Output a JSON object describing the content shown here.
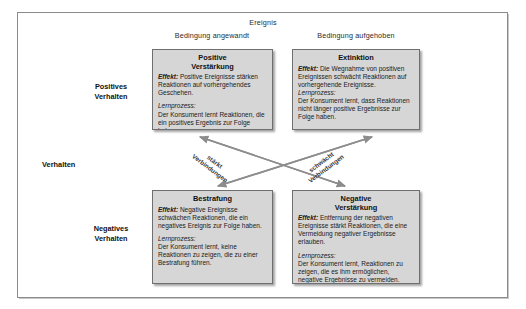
{
  "diagram": {
    "top_title": "Ereignis",
    "axis_label": "Verhalten",
    "columns": [
      {
        "label": "Bedingung angewandt"
      },
      {
        "label": "Bedingung aufgehoben"
      }
    ],
    "rows": [
      {
        "label_line1": "Positives",
        "label_line2": "Verhalten"
      },
      {
        "label_line1": "Negatives",
        "label_line2": "Verhalten"
      }
    ],
    "arrows": [
      {
        "line1": "stärkt",
        "line2": "Verbindungen"
      },
      {
        "line1": "schwächt",
        "line2": "Verbindungen"
      }
    ],
    "quadrants": {
      "q1": {
        "title_line1": "Positive",
        "title_line2": "Verstärkung",
        "effect_label": "Effekt:",
        "effect_text": " Positive Ereignisse stärken Reaktionen auf vorhergehendes Geschehen.",
        "process_label": "Lernprozess:",
        "process_text": "Der Konsument lernt Reaktionen, die ein positives Ergebnis zur Folge haben."
      },
      "q2": {
        "title_line1": "Extinktion",
        "title_line2": "",
        "effect_label": "Effekt:",
        "effect_text": " Die Wegnahme von positiven Ereignissen schwächt Reaktionen auf vorhergehende Ereignisse.",
        "process_label": "Lernprozess:",
        "process_text": "Der Konsument lernt, dass Reaktionen nicht länger positive Ergebnisse zur Folge haben."
      },
      "q3": {
        "title_line1": "Bestrafung",
        "title_line2": "",
        "effect_label": "Effekt:",
        "effect_text": " Negative Ereignisse schwächen Reaktionen, die ein negatives Ereignis zur Folge haben.",
        "process_label": "Lernprozess:",
        "process_text": "Der Konsument lernt, keine Reaktionen zu zeigen, die zu einer Bestrafung führen."
      },
      "q4": {
        "title_line1": "Negative",
        "title_line2": "Verstärkung",
        "effect_label": "Effekt:",
        "effect_text": " Entfernung der negativen Ereignisse stärkt Reaktionen, die eine Vermeidung negativer Ergebnisse erlauben.",
        "process_label": "Lernprozess:",
        "process_text": "Der Konsument lernt, Reaktionen zu zeigen, die es ihm ermöglichen, negative Ergebnisse zu vermeiden."
      }
    },
    "colors": {
      "box_fill": "#d6d6d6",
      "box_border": "#6f6f6f",
      "frame_border": "#8a8a8a",
      "arrow": "#8d8d8d"
    }
  }
}
